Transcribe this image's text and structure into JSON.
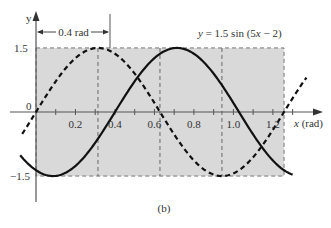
{
  "chart_data": {
    "type": "line",
    "title": "",
    "caption": "(b)",
    "xlabel": "x (rad)",
    "ylabel": "y",
    "xlim": [
      -0.08,
      1.45
    ],
    "ylim": [
      -1.5,
      1.5
    ],
    "x_ticks": [
      0.2,
      0.4,
      0.6,
      0.8,
      1.0,
      1.2
    ],
    "x_tick_labels": [
      "0.2",
      "0.4",
      "0.6",
      "0.8",
      "1.0",
      "1.2"
    ],
    "x_minor_tick_step": 0.1,
    "y_ticks": [
      1.5,
      0,
      -1.5
    ],
    "y_tick_labels": [
      "1.5",
      "0",
      "-1.5"
    ],
    "grid": false,
    "shaded_region": {
      "x": [
        0,
        1.2566
      ],
      "y": [
        -1.5,
        1.5
      ],
      "color": "#d9d9d9"
    },
    "reference_lines_x": [
      0.314,
      0.628,
      0.942
    ],
    "series": [
      {
        "name": "y = 1.5 sin(5x)",
        "style": "dashed",
        "color": "#111111",
        "amplitude": 1.5,
        "omega": 5,
        "phase": 0,
        "x_range": [
          -0.07,
          1.37
        ]
      },
      {
        "name": "y = 1.5 sin (5x − 2)",
        "style": "solid",
        "color": "#111111",
        "amplitude": 1.5,
        "omega": 5,
        "phase": -2,
        "x_range": [
          -0.08,
          1.3
        ]
      }
    ],
    "annotations": [
      {
        "text": "0.4 rad",
        "type": "dimension-arrow",
        "x_from": 0,
        "x_to": 0.4
      },
      {
        "text": "y = 1.5 sin (5x − 2)",
        "type": "curve-label"
      }
    ]
  },
  "labels": {
    "y_axis": "y",
    "x_axis_var": "x",
    "x_axis_unit": "(rad)",
    "y_top": "1.5",
    "y_zero": "0",
    "y_bottom": "−1.5",
    "shift": "0.4 rad",
    "equation_prefix": "y",
    "equation_rest": " = 1.5 sin (5",
    "equation_x": "x",
    "equation_end": " − 2)",
    "caption": "(b)",
    "ticks": [
      "0.2",
      "0.4",
      "0.6",
      "0.8",
      "1.0",
      "1.2"
    ]
  }
}
